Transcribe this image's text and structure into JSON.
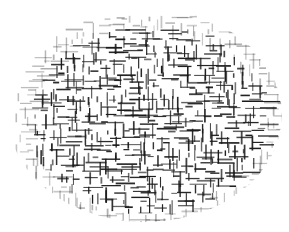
{
  "artwork": {
    "description": "Abstract composition of short black horizontal and vertical line segments (plus and minus marks) forming an oval on a white background",
    "colors": {
      "background": "#ffffff",
      "ink": "#1a1a1a"
    },
    "oval": {
      "cx": 145,
      "cy": 115,
      "rx": 137,
      "ry": 107
    }
  }
}
